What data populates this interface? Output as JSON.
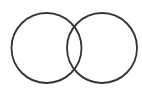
{
  "diagram": {
    "type": "venn",
    "background": "#ffffff",
    "stroke_color": "#333333",
    "circles": [
      {
        "name": "left-circle",
        "cx": 46.5,
        "cy": 48,
        "r": 35
      },
      {
        "name": "right-circle",
        "cx": 102,
        "cy": 48,
        "r": 35
      }
    ]
  }
}
